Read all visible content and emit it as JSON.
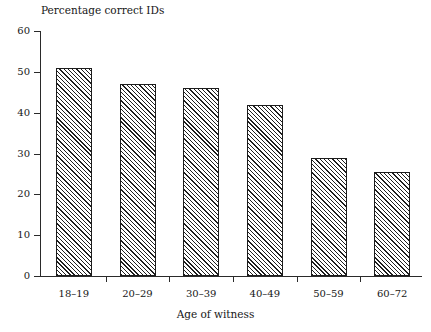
{
  "chart_data": {
    "type": "bar",
    "title": "Percentage correct IDs",
    "xlabel": "Age of witness",
    "ylabel": "",
    "categories": [
      "18–19",
      "20–29",
      "30–39",
      "40–49",
      "50–59",
      "60–72"
    ],
    "values": [
      51,
      47,
      46,
      42,
      29,
      25.5
    ],
    "ylim": [
      0,
      60
    ],
    "yticks": [
      0,
      10,
      20,
      30,
      40,
      50,
      60
    ],
    "ytick_labels": [
      "0",
      "10",
      "20",
      "30",
      "40",
      "50",
      "60"
    ],
    "grid": false,
    "legend": false,
    "series": [
      {
        "name": "Percentage correct IDs",
        "values": [
          51,
          47,
          46,
          42,
          29,
          25.5
        ]
      }
    ],
    "bar_style": {
      "fill": "#ffffff",
      "hatch": "diagonal-forward",
      "hatch_color": "#1f1f1f",
      "border_color": "#1c1c1c"
    },
    "axis_color": "#2a2a2a",
    "background": "#ffffff"
  }
}
